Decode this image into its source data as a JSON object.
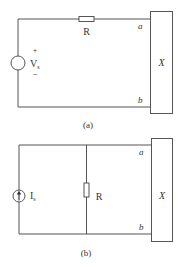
{
  "figures": [
    {
      "id": "a",
      "caption": "(a)",
      "source": {
        "type": "voltage-source",
        "label": "V",
        "subscript": "s",
        "plus": "+",
        "minus": "−"
      },
      "resistor": {
        "label": "R",
        "placement": "series-top"
      },
      "terminals": {
        "top": "a",
        "bottom": "b"
      },
      "load": {
        "label": "X"
      }
    },
    {
      "id": "b",
      "caption": "(b)",
      "source": {
        "type": "current-source",
        "label": "I",
        "subscript": "s",
        "direction": "up"
      },
      "resistor": {
        "label": "R",
        "placement": "shunt"
      },
      "terminals": {
        "top": "a",
        "bottom": "b"
      },
      "load": {
        "label": "X"
      }
    }
  ],
  "colors": {
    "line": "#555555",
    "text": "#333333",
    "background": "#ffffff"
  }
}
